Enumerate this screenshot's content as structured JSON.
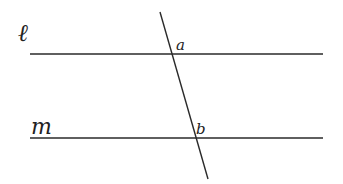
{
  "diagram": {
    "colors": {
      "stroke": "#2a2a2a",
      "label": "#222222",
      "background": "#ffffff"
    },
    "lines": [
      {
        "id": "l",
        "label": "ℓ",
        "x1": 30,
        "y1": 54,
        "x2": 323,
        "y2": 54
      },
      {
        "id": "m",
        "label": "m",
        "x1": 30,
        "y1": 138,
        "x2": 323,
        "y2": 138
      },
      {
        "id": "transversal",
        "label": "",
        "x1": 160,
        "y1": 12,
        "x2": 208,
        "y2": 179
      }
    ],
    "points": [
      {
        "id": "a",
        "label": "a",
        "x": 172,
        "y": 54
      },
      {
        "id": "b",
        "label": "b",
        "x": 196,
        "y": 138
      }
    ],
    "labels": {
      "line_l": "ℓ",
      "line_m": "m",
      "point_a": "a",
      "point_b": "b"
    }
  }
}
